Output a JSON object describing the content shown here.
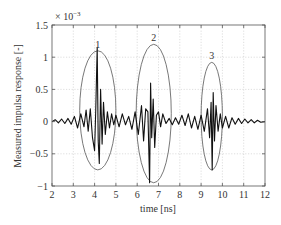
{
  "chart_data": {
    "type": "line",
    "title": "",
    "xlabel": "time [ns]",
    "ylabel": "Measured impulsa response [-]",
    "y_multiplier": "× 10^-3",
    "y_multiplier_base": "× 10",
    "y_multiplier_exp": "−3",
    "xlim": [
      2,
      12
    ],
    "ylim": [
      -1,
      1.5
    ],
    "xticks": [
      2,
      3,
      4,
      5,
      6,
      7,
      8,
      9,
      10,
      11,
      12
    ],
    "xtick_labels": [
      "2",
      "3",
      "4",
      "5",
      "6",
      "7",
      "8",
      "9",
      "10",
      "11",
      "12"
    ],
    "yticks": [
      -1,
      -0.5,
      0,
      0.5,
      1,
      1.5
    ],
    "ytick_labels": [
      "−1",
      "−0.5",
      "0",
      "0.5",
      "1",
      "1.5"
    ],
    "grid": true,
    "legend": null,
    "series": [
      {
        "name": "impulse response",
        "x": [
          2.0,
          2.15,
          2.3,
          2.45,
          2.6,
          2.75,
          2.9,
          3.05,
          3.2,
          3.35,
          3.5,
          3.6,
          3.7,
          3.8,
          3.9,
          4.0,
          4.05,
          4.12,
          4.17,
          4.22,
          4.28,
          4.35,
          4.42,
          4.5,
          4.6,
          4.7,
          4.8,
          4.9,
          5.0,
          5.15,
          5.3,
          5.45,
          5.6,
          5.75,
          5.9,
          6.05,
          6.2,
          6.3,
          6.4,
          6.5,
          6.58,
          6.63,
          6.68,
          6.75,
          6.82,
          6.9,
          7.0,
          7.1,
          7.2,
          7.35,
          7.5,
          7.65,
          7.8,
          7.95,
          8.1,
          8.25,
          8.4,
          8.55,
          8.7,
          8.85,
          9.0,
          9.15,
          9.3,
          9.4,
          9.47,
          9.52,
          9.57,
          9.63,
          9.7,
          9.8,
          9.9,
          10.0,
          10.15,
          10.3,
          10.45,
          10.6,
          10.75,
          10.9,
          11.05,
          11.2,
          11.35,
          11.5,
          11.65,
          11.8,
          12.0
        ],
        "y": [
          0.0,
          0.03,
          -0.02,
          0.04,
          -0.03,
          0.05,
          -0.04,
          0.08,
          -0.1,
          0.12,
          -0.08,
          0.18,
          -0.15,
          0.2,
          -0.25,
          -0.45,
          0.15,
          1.15,
          -0.3,
          -0.65,
          0.5,
          -0.35,
          0.3,
          -0.2,
          0.15,
          -0.1,
          0.12,
          -0.05,
          0.1,
          -0.08,
          0.12,
          -0.05,
          0.08,
          -0.12,
          0.15,
          -0.2,
          0.25,
          -0.3,
          0.2,
          0.15,
          -0.95,
          0.6,
          -0.25,
          0.35,
          -0.4,
          0.1,
          0.15,
          -0.08,
          0.12,
          -0.03,
          0.05,
          -0.05,
          0.06,
          -0.04,
          0.1,
          -0.06,
          0.12,
          -0.1,
          0.08,
          -0.12,
          0.1,
          -0.15,
          0.2,
          -0.25,
          0.3,
          -0.75,
          0.45,
          -0.3,
          0.25,
          -0.15,
          0.12,
          -0.1,
          0.08,
          -0.1,
          0.06,
          -0.04,
          0.05,
          -0.03,
          0.04,
          -0.02,
          0.03,
          -0.02,
          0.02,
          -0.01,
          0.0
        ]
      }
    ],
    "annotations": [
      {
        "label": "1",
        "type": "ellipse",
        "center_x": 4.15,
        "center_y": 0.2,
        "x_range": [
          3.3,
          5.0
        ],
        "y_range": [
          -0.75,
          1.1
        ]
      },
      {
        "label": "2",
        "type": "ellipse",
        "center_x": 6.7,
        "center_y": 0.12,
        "x_range": [
          5.95,
          7.6
        ],
        "y_range": [
          -0.95,
          1.2
        ]
      },
      {
        "label": "3",
        "type": "ellipse",
        "center_x": 9.5,
        "center_y": 0.1,
        "x_range": [
          9.0,
          10.0
        ],
        "y_range": [
          -0.75,
          0.92
        ]
      }
    ]
  }
}
